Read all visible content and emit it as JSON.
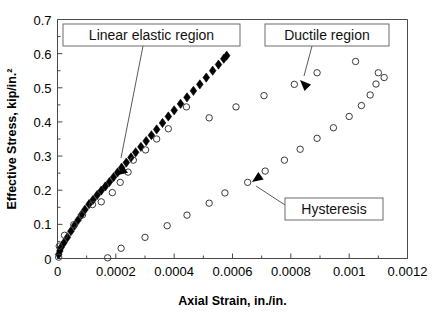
{
  "figure": {
    "background": "#ffffff",
    "frame_color": "#4a4a4a",
    "width": 439,
    "height": 314
  },
  "chart_data": {
    "type": "scatter",
    "title": "",
    "xlabel": "Axial Strain, in./in.",
    "ylabel": "Effective Stress, kip/in.²",
    "xlim": [
      0,
      0.0012
    ],
    "ylim": [
      0,
      0.7
    ],
    "xticks": [
      0,
      0.0002,
      0.0004,
      0.0006,
      0.0008,
      0.001,
      0.0012
    ],
    "xticklabels": [
      "0",
      "0.0002",
      "0.0004",
      "0.0006",
      "0.0008",
      "0.001",
      "0.0012"
    ],
    "yticks": [
      0,
      0.1,
      0.2,
      0.3,
      0.4,
      0.5,
      0.6,
      0.7
    ],
    "yticklabels": [
      "0",
      "0.1",
      "0.2",
      "0.3",
      "0.4",
      "0.5",
      "0.6",
      "0.7"
    ],
    "minor_ticks": true,
    "grid": false,
    "legend": "none",
    "series": [
      {
        "name": "Linear elastic region",
        "marker": "filled-diamond",
        "marker_color": "#000000",
        "marker_size": 4.6,
        "points": [
          [
            4e-06,
            0.012
          ],
          [
            8e-06,
            0.022
          ],
          [
            1.2e-05,
            0.032
          ],
          [
            2.2e-05,
            0.046
          ],
          [
            3.4e-05,
            0.062
          ],
          [
            4.6e-05,
            0.08
          ],
          [
            5.8e-05,
            0.096
          ],
          [
            7e-05,
            0.112
          ],
          [
            8.2e-05,
            0.128
          ],
          [
            9.4e-05,
            0.143
          ],
          [
            0.000108,
            0.159
          ],
          [
            0.000122,
            0.172
          ],
          [
            0.000136,
            0.186
          ],
          [
            0.00015,
            0.199
          ],
          [
            0.000164,
            0.211
          ],
          [
            0.000178,
            0.224
          ],
          [
            0.000192,
            0.238
          ],
          [
            0.000206,
            0.252
          ],
          [
            0.00022,
            0.266
          ],
          [
            0.000236,
            0.281
          ],
          [
            0.000252,
            0.296
          ],
          [
            0.000268,
            0.311
          ],
          [
            0.000286,
            0.327
          ],
          [
            0.000304,
            0.344
          ],
          [
            0.000322,
            0.361
          ],
          [
            0.00034,
            0.378
          ],
          [
            0.00036,
            0.397
          ],
          [
            0.00038,
            0.416
          ],
          [
            0.0004,
            0.434
          ],
          [
            0.000422,
            0.453
          ],
          [
            0.000444,
            0.472
          ],
          [
            0.000466,
            0.491
          ],
          [
            0.000488,
            0.51
          ],
          [
            0.00051,
            0.53
          ],
          [
            0.000532,
            0.55
          ],
          [
            0.000552,
            0.568
          ],
          [
            0.00057,
            0.585
          ],
          [
            0.00058,
            0.594
          ]
        ]
      },
      {
        "name": "Ductile region",
        "marker": "open-circle",
        "marker_color": "#3a3a3a",
        "marker_size": 3.2,
        "points": [
          [
            4e-06,
            0.004
          ],
          [
            6e-06,
            0.036
          ],
          [
            2.4e-05,
            0.068
          ],
          [
            5.6e-05,
            0.099
          ],
          [
            8.6e-05,
            0.128
          ],
          [
            0.00012,
            0.158
          ],
          [
            0.00015,
            0.166
          ],
          [
            0.000188,
            0.193
          ],
          [
            0.000215,
            0.223
          ],
          [
            0.000242,
            0.253
          ],
          [
            0.00026,
            0.288
          ],
          [
            0.000302,
            0.318
          ],
          [
            0.00034,
            0.35
          ],
          [
            0.00038,
            0.38
          ],
          [
            0.000442,
            0.444
          ],
          [
            0.00052,
            0.412
          ],
          [
            0.000612,
            0.444
          ],
          [
            0.000708,
            0.477
          ],
          [
            0.000812,
            0.51
          ],
          [
            0.00089,
            0.544
          ],
          [
            0.001022,
            0.577
          ],
          [
            0.0011,
            0.544
          ],
          [
            0.00112,
            0.53
          ]
        ]
      },
      {
        "name": "Hysteresis",
        "marker": "open-circle",
        "marker_color": "#3a3a3a",
        "marker_size": 3.2,
        "points": [
          [
            0.000172,
            0.002
          ],
          [
            0.000218,
            0.03
          ],
          [
            0.0003,
            0.062
          ],
          [
            0.000376,
            0.096
          ],
          [
            0.000444,
            0.127
          ],
          [
            0.00052,
            0.162
          ],
          [
            0.000574,
            0.192
          ],
          [
            0.000652,
            0.223
          ],
          [
            0.000712,
            0.256
          ],
          [
            0.000778,
            0.288
          ],
          [
            0.000832,
            0.32
          ],
          [
            0.00089,
            0.352
          ],
          [
            0.000946,
            0.383
          ],
          [
            0.001,
            0.416
          ],
          [
            0.001042,
            0.448
          ],
          [
            0.001072,
            0.479
          ],
          [
            0.001092,
            0.511
          ]
        ]
      }
    ],
    "annotations": [
      {
        "id": "linear-elastic",
        "label": "Linear elastic region",
        "box": {
          "x": 63,
          "y": 24,
          "w": 177,
          "h": 22
        },
        "leader": {
          "x1": 143,
          "y1": 46,
          "x2": 121,
          "y2": 158
        },
        "arrow_at": {
          "x": 121,
          "y": 163
        },
        "arrow_angle": 257
      },
      {
        "id": "ductile-region",
        "label": "Ductile region",
        "box": {
          "x": 265,
          "y": 24,
          "w": 124,
          "h": 22
        },
        "leader": {
          "x1": 312,
          "y1": 46,
          "x2": 304,
          "y2": 76
        },
        "arrow_at": {
          "x": 300,
          "y": 80
        },
        "arrow_angle": 225
      },
      {
        "id": "hysteresis",
        "label": "Hysteresis",
        "box": {
          "x": 285,
          "y": 198,
          "w": 98,
          "h": 22
        },
        "leader": {
          "x1": 285,
          "y1": 205,
          "x2": 256,
          "y2": 186
        },
        "arrow_at": {
          "x": 252,
          "y": 182
        },
        "arrow_angle": 145
      }
    ]
  },
  "partial_top_text": ""
}
